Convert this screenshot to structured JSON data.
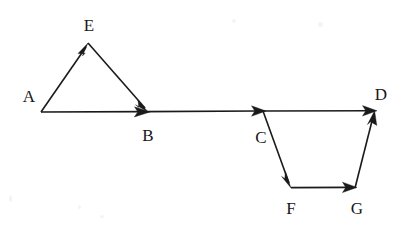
{
  "canvas": {
    "width": 405,
    "height": 227,
    "background": "#ffffff",
    "ink_color": "#1a1a1a"
  },
  "diagram": {
    "type": "directed-graph",
    "nodes": [
      {
        "id": "A",
        "label": "A",
        "x": 41,
        "y": 112,
        "label_x": 29,
        "label_y": 96
      },
      {
        "id": "E",
        "label": "E",
        "x": 88,
        "y": 43,
        "label_x": 89,
        "label_y": 25
      },
      {
        "id": "B",
        "label": "B",
        "x": 148,
        "y": 112,
        "label_x": 148,
        "label_y": 135
      },
      {
        "id": "C",
        "label": "C",
        "x": 263,
        "y": 111,
        "label_x": 261,
        "label_y": 137
      },
      {
        "id": "D",
        "label": "D",
        "x": 375,
        "y": 111,
        "label_x": 381,
        "label_y": 94
      },
      {
        "id": "F",
        "label": "F",
        "x": 291,
        "y": 188,
        "label_x": 291,
        "label_y": 208
      },
      {
        "id": "G",
        "label": "G",
        "x": 355,
        "y": 188,
        "label_x": 357,
        "label_y": 208
      }
    ],
    "edges": [
      {
        "id": "A-E",
        "from": "A",
        "to": "E",
        "directed": true
      },
      {
        "id": "E-B",
        "from": "E",
        "to": "B",
        "directed": true
      },
      {
        "id": "A-B",
        "from": "A",
        "to": "B",
        "directed": true
      },
      {
        "id": "B-C",
        "from": "B",
        "to": "C",
        "directed": true
      },
      {
        "id": "C-D",
        "from": "C",
        "to": "D",
        "directed": true
      },
      {
        "id": "C-F",
        "from": "C",
        "to": "F",
        "directed": true
      },
      {
        "id": "F-G",
        "from": "F",
        "to": "G",
        "directed": true
      },
      {
        "id": "G-D",
        "from": "G",
        "to": "D",
        "directed": true
      }
    ]
  }
}
